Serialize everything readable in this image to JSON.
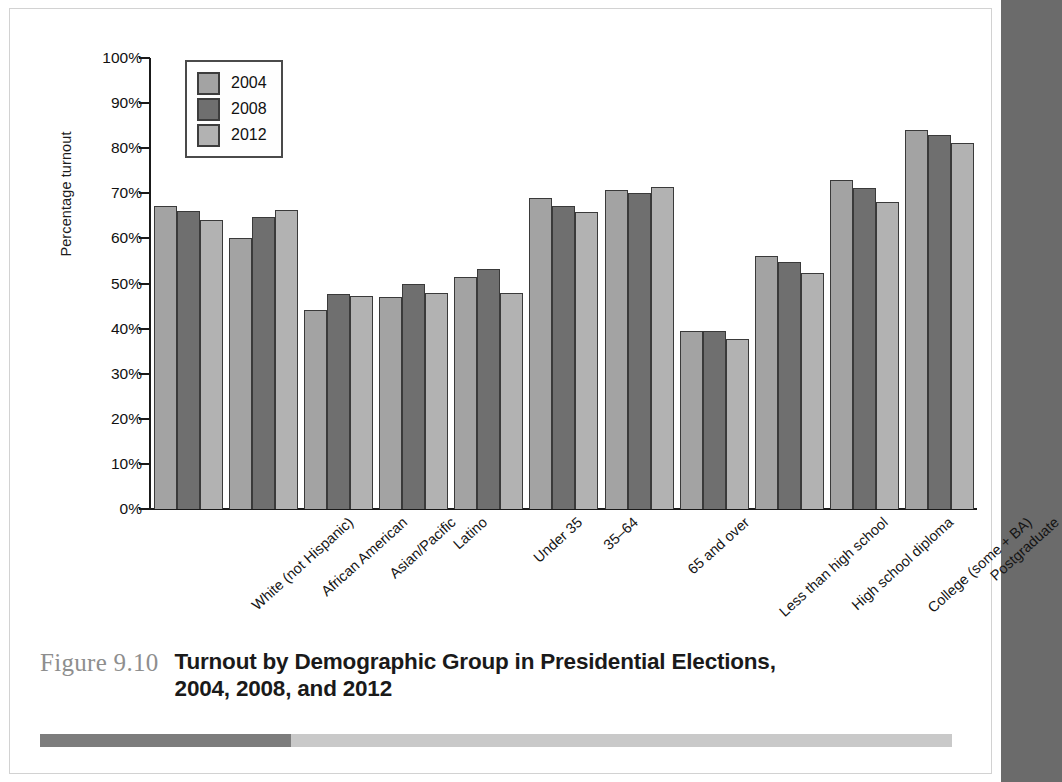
{
  "figure": {
    "number": "Figure 9.10",
    "title_line1": "Turnout by Demographic Group in Presidential Elections,",
    "title_line2": "2004, 2008, and 2012"
  },
  "legend": {
    "position": "top-left-inside",
    "entries": [
      {
        "label": "2004",
        "color": "#a3a3a3"
      },
      {
        "label": "2008",
        "color": "#6f6f6f"
      },
      {
        "label": "2012",
        "color": "#b2b2b2"
      }
    ]
  },
  "chart_data": {
    "type": "bar",
    "title": "Turnout by Demographic Group in Presidential Elections, 2004, 2008, and 2012",
    "xlabel": "",
    "ylabel": "Percentage turnout",
    "ylim": [
      0,
      100
    ],
    "ytick_labels": [
      "100%",
      "90%",
      "80%",
      "70%",
      "60%",
      "50%",
      "40%",
      "30%",
      "20%",
      "10%",
      "0%"
    ],
    "ytick_values": [
      100,
      90,
      80,
      70,
      60,
      50,
      40,
      30,
      20,
      10,
      0
    ],
    "grid": false,
    "categories": [
      "White (not Hispanic)",
      "African American",
      "Asian/Pacific",
      "Latino",
      "Under 35",
      "35–64",
      "65 and over",
      "Less than high school",
      "High school diploma",
      "College (some + BA)",
      "Postgraduate"
    ],
    "series": [
      {
        "name": "2004",
        "color": "#a3a3a3",
        "values": [
          67.2,
          60.0,
          44.1,
          47.0,
          51.5,
          69.0,
          70.8,
          39.4,
          56.2,
          73.0,
          84.0
        ]
      },
      {
        "name": "2008",
        "color": "#6f6f6f",
        "values": [
          66.1,
          64.8,
          47.6,
          49.9,
          53.3,
          67.1,
          70.0,
          39.4,
          54.7,
          71.2,
          83.0
        ]
      },
      {
        "name": "2012",
        "color": "#b2b2b2",
        "values": [
          64.1,
          66.2,
          47.3,
          48.0,
          48.0,
          65.8,
          71.5,
          37.7,
          52.3,
          68.1,
          81.1
        ]
      }
    ]
  }
}
